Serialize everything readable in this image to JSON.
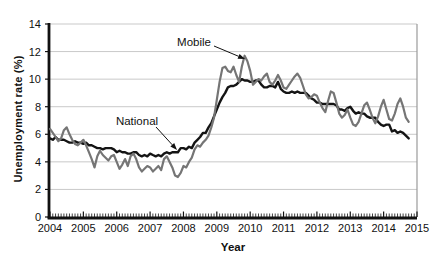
{
  "figure": {
    "background": "#ffffff"
  },
  "chart_data": {
    "type": "line",
    "title": "",
    "xlabel": "Year",
    "ylabel": "Unemployment rate (%)",
    "xlim": [
      2004,
      2015
    ],
    "ylim": [
      0,
      14
    ],
    "x_ticks": [
      2004,
      2005,
      2006,
      2007,
      2008,
      2009,
      2010,
      2011,
      2012,
      2013,
      2014,
      2015
    ],
    "y_ticks": [
      0,
      2,
      4,
      6,
      8,
      10,
      12,
      14
    ],
    "grid": "horizontal-light",
    "minor_x_ticks": "monthly",
    "legend": "inline-annotations",
    "x_start_year": 2004,
    "points_per_year": 12,
    "series": [
      {
        "name": "National",
        "color": "#141414",
        "width": 2.4,
        "values": [
          5.7,
          5.6,
          5.8,
          5.6,
          5.6,
          5.6,
          5.5,
          5.4,
          5.4,
          5.5,
          5.4,
          5.4,
          5.3,
          5.4,
          5.2,
          5.2,
          5.1,
          5.0,
          5.0,
          4.9,
          5.0,
          5.0,
          5.0,
          4.9,
          4.7,
          4.8,
          4.7,
          4.7,
          4.6,
          4.6,
          4.7,
          4.7,
          4.5,
          4.4,
          4.5,
          4.4,
          4.6,
          4.5,
          4.4,
          4.5,
          4.4,
          4.6,
          4.7,
          4.6,
          4.7,
          4.7,
          4.7,
          5.0,
          5.0,
          4.9,
          5.1,
          5.0,
          5.4,
          5.6,
          5.8,
          6.1,
          6.1,
          6.5,
          6.8,
          7.3,
          7.8,
          8.3,
          8.7,
          9.0,
          9.4,
          9.5,
          9.5,
          9.6,
          9.8,
          10.0,
          9.9,
          9.9,
          9.8,
          9.8,
          9.9,
          9.9,
          9.6,
          9.4,
          9.4,
          9.5,
          9.5,
          9.4,
          9.8,
          9.3,
          9.1,
          9.0,
          9.0,
          9.1,
          9.0,
          9.1,
          9.0,
          9.0,
          9.0,
          8.8,
          8.6,
          8.5,
          8.3,
          8.3,
          8.2,
          8.2,
          8.2,
          8.2,
          8.2,
          8.1,
          7.8,
          7.8,
          7.7,
          7.9,
          8.0,
          7.7,
          7.5,
          7.6,
          7.5,
          7.5,
          7.3,
          7.2,
          7.2,
          7.2,
          6.9,
          6.7,
          6.6,
          6.7,
          6.7,
          6.2,
          6.3,
          6.1,
          6.2,
          6.1,
          5.9,
          5.7
        ]
      },
      {
        "name": "Mobile",
        "color": "#757575",
        "width": 2.2,
        "values": [
          6.4,
          6.1,
          5.8,
          5.5,
          5.7,
          6.3,
          6.5,
          6.0,
          5.6,
          5.3,
          5.2,
          5.4,
          5.6,
          5.2,
          4.7,
          4.2,
          3.6,
          4.4,
          4.8,
          4.5,
          4.3,
          4.1,
          4.4,
          4.5,
          4.0,
          3.5,
          3.8,
          4.2,
          3.7,
          4.4,
          4.6,
          4.2,
          3.6,
          3.3,
          3.5,
          3.7,
          3.6,
          3.3,
          3.5,
          3.7,
          3.4,
          4.2,
          4.4,
          4.0,
          3.6,
          3.0,
          2.9,
          3.2,
          3.7,
          3.6,
          4.0,
          4.3,
          4.9,
          5.2,
          5.1,
          5.4,
          5.6,
          5.9,
          6.5,
          7.2,
          8.5,
          9.8,
          10.8,
          10.9,
          10.6,
          10.5,
          10.9,
          10.3,
          9.8,
          10.9,
          11.7,
          11.3,
          10.6,
          9.6,
          9.8,
          10.0,
          9.9,
          10.2,
          10.4,
          9.8,
          9.6,
          9.9,
          10.3,
          9.9,
          9.4,
          9.3,
          9.6,
          9.9,
          10.2,
          10.4,
          10.1,
          9.5,
          8.9,
          8.6,
          8.7,
          8.9,
          8.8,
          8.3,
          7.9,
          7.6,
          8.4,
          9.1,
          9.0,
          8.3,
          7.5,
          7.2,
          7.4,
          7.8,
          7.2,
          6.7,
          6.6,
          6.9,
          7.5,
          8.1,
          8.3,
          7.8,
          7.2,
          6.8,
          7.3,
          8.0,
          8.5,
          7.8,
          7.1,
          7.0,
          7.5,
          8.2,
          8.6,
          8.0,
          7.2,
          6.9
        ]
      }
    ],
    "annotations": [
      {
        "label": "Mobile",
        "points_to": "Mobile series peak"
      },
      {
        "label": "National",
        "points_to": "National series 2008"
      }
    ]
  },
  "colors": {
    "axis": "#111111",
    "grid": "#c9c9c9",
    "right_border": "#9a9a9a",
    "tick_label": "#111111"
  }
}
